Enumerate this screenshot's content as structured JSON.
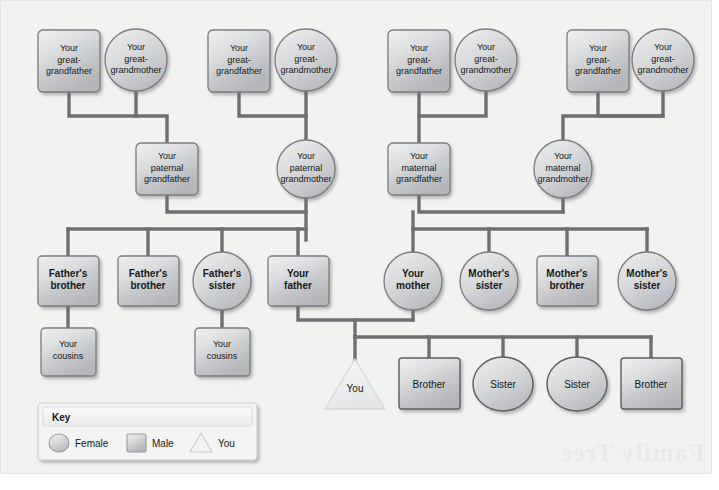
{
  "diagram": {
    "title": "Family tree",
    "line_color": "#6e6f72",
    "shape_fill_light": "#e9eaec",
    "shape_fill_dark": "#b9bbbe",
    "shape_stroke": "#7b7d80",
    "you_fill": "#f0f1f2",
    "page_bg": "#f2f2f1",
    "text_color": "#17181a"
  },
  "generations": {
    "great_grandparents": [
      {
        "id": "ggf1",
        "label": "Your great-grandfather",
        "shape": "square",
        "cx": 69,
        "cy": 61
      },
      {
        "id": "ggm1",
        "label": "Your great-grandmother",
        "shape": "circle",
        "cx": 136,
        "cy": 61
      },
      {
        "id": "ggf2",
        "label": "Your great-grandfather",
        "shape": "square",
        "cx": 239,
        "cy": 61
      },
      {
        "id": "ggm2",
        "label": "Your great-grandmother",
        "shape": "circle",
        "cx": 306,
        "cy": 61
      },
      {
        "id": "ggf3",
        "label": "Your great-grandfather",
        "shape": "square",
        "cx": 419,
        "cy": 61
      },
      {
        "id": "ggm3",
        "label": "Your great-grandmother",
        "shape": "circle",
        "cx": 486,
        "cy": 61
      },
      {
        "id": "ggf4",
        "label": "Your great-grandfather",
        "shape": "square",
        "cx": 598,
        "cy": 61
      },
      {
        "id": "ggm4",
        "label": "Your great-grandmother",
        "shape": "circle",
        "cx": 663,
        "cy": 61
      }
    ],
    "grandparents": [
      {
        "id": "pgf",
        "label": "Your paternal grandfather",
        "shape": "square",
        "cx": 167,
        "cy": 169
      },
      {
        "id": "pgm",
        "label": "Your paternal grandmother",
        "shape": "circle",
        "cx": 306,
        "cy": 169
      },
      {
        "id": "mgf",
        "label": "Your maternal grandfather",
        "shape": "square",
        "cx": 419,
        "cy": 169
      },
      {
        "id": "mgm",
        "label": "Your maternal grandmother",
        "shape": "circle",
        "cx": 563,
        "cy": 169
      }
    ],
    "parents_generation": [
      {
        "id": "fb1",
        "label": "Father's brother",
        "shape": "square",
        "cx": 68,
        "cy": 281,
        "bold": true
      },
      {
        "id": "fb2",
        "label": "Father's brother",
        "shape": "square",
        "cx": 148,
        "cy": 281,
        "bold": true
      },
      {
        "id": "fs1",
        "label": "Father's sister",
        "shape": "circle",
        "cx": 222,
        "cy": 281,
        "bold": true
      },
      {
        "id": "dad",
        "label": "Your father",
        "shape": "square",
        "cx": 298,
        "cy": 281,
        "bold": true
      },
      {
        "id": "mom",
        "label": "Your mother",
        "shape": "circle",
        "cx": 413,
        "cy": 281,
        "bold": true
      },
      {
        "id": "ms1",
        "label": "Mother's sister",
        "shape": "circle",
        "cx": 489,
        "cy": 281,
        "bold": true
      },
      {
        "id": "mb1",
        "label": "Mother's brother",
        "shape": "square",
        "cx": 567,
        "cy": 281,
        "bold": true
      },
      {
        "id": "ms2",
        "label": "Mother's sister",
        "shape": "circle",
        "cx": 647,
        "cy": 281,
        "bold": true
      }
    ],
    "cousins": [
      {
        "id": "cz1",
        "label": "Your cousins",
        "shape": "square",
        "cx": 68,
        "cy": 352
      },
      {
        "id": "cz2",
        "label": "Your cousins",
        "shape": "square",
        "cx": 222,
        "cy": 352
      }
    ],
    "siblings": [
      {
        "id": "you",
        "label": "You",
        "shape": "triangle",
        "cx": 355,
        "cy": 383
      },
      {
        "id": "br1",
        "label": "Brother",
        "shape": "square",
        "cx": 429,
        "cy": 383
      },
      {
        "id": "si1",
        "label": "Sister",
        "shape": "circle",
        "cx": 503,
        "cy": 383
      },
      {
        "id": "si2",
        "label": "Sister",
        "shape": "circle",
        "cx": 577,
        "cy": 383
      },
      {
        "id": "br2",
        "label": "Brother",
        "shape": "square",
        "cx": 651,
        "cy": 383
      }
    ]
  },
  "key": {
    "title": "Key",
    "items": [
      {
        "shape": "circle",
        "label": "Female"
      },
      {
        "shape": "square",
        "label": "Male"
      },
      {
        "shape": "triangle",
        "label": "You"
      }
    ]
  },
  "watermark": {
    "text": "Family Tree"
  }
}
